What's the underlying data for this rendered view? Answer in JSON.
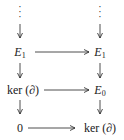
{
  "diagram": {
    "type": "commutative-diagram",
    "left_column": {
      "dots": "⋮",
      "row1": {
        "base": "E",
        "sub": "1"
      },
      "row2": "ker (∂)",
      "row3": "0"
    },
    "right_column": {
      "dots": "⋮",
      "row1": {
        "base": "E",
        "sub": "1"
      },
      "row2": {
        "base": "E",
        "sub": "0"
      },
      "row3": "ker (∂)"
    },
    "arrows": [
      {
        "from": "left.dots",
        "to": "left.E1",
        "direction": "down"
      },
      {
        "from": "right.dots",
        "to": "right.E1",
        "direction": "down"
      },
      {
        "from": "left.E1",
        "to": "right.E1",
        "direction": "right"
      },
      {
        "from": "left.E1",
        "to": "left.ker",
        "direction": "down"
      },
      {
        "from": "right.E1",
        "to": "right.E0",
        "direction": "down"
      },
      {
        "from": "left.ker",
        "to": "right.E0",
        "direction": "right"
      },
      {
        "from": "left.ker",
        "to": "left.0",
        "direction": "down"
      },
      {
        "from": "right.E0",
        "to": "right.ker",
        "direction": "down"
      },
      {
        "from": "left.0",
        "to": "right.ker",
        "direction": "right"
      }
    ],
    "colors": {
      "ink": "#222222",
      "background": "#ffffff"
    }
  }
}
